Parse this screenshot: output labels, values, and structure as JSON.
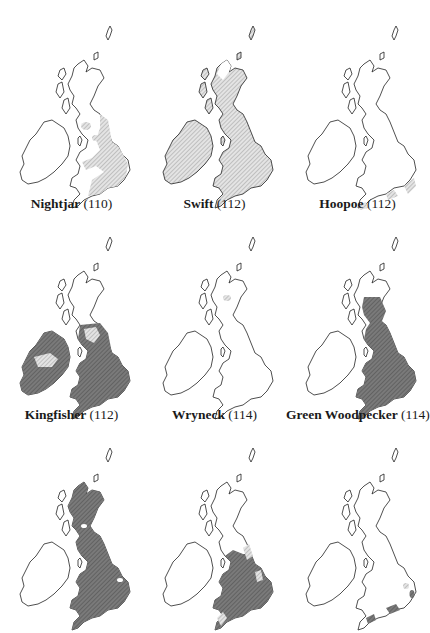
{
  "figure": {
    "type": "species-distribution-map-grid",
    "region": "British Isles",
    "layout": {
      "rows": 3,
      "cols": 3
    },
    "shading_legend": {
      "light_hatch": "#c9c9c9",
      "dark_hatch": "#6d6d6d",
      "outline": "#222222"
    },
    "maps": [
      {
        "name": "Nightjar",
        "page": "(110)",
        "shade": "light",
        "has_label": true
      },
      {
        "name": "Swift",
        "page": "(112)",
        "shade": "light",
        "has_label": true
      },
      {
        "name": "Hoopoe",
        "page": "(112)",
        "shade": "light",
        "has_label": true
      },
      {
        "name": "Kingfisher",
        "page": "(112)",
        "shade": "dark",
        "has_label": true
      },
      {
        "name": "Wryneck",
        "page": "(114)",
        "shade": "light",
        "has_label": true
      },
      {
        "name": "Green Woodpecker",
        "page": "(114)",
        "shade": "dark",
        "has_label": true
      },
      {
        "name": "",
        "page": "",
        "shade": "dark",
        "has_label": false
      },
      {
        "name": "",
        "page": "",
        "shade": "dark",
        "has_label": false
      },
      {
        "name": "",
        "page": "",
        "shade": "dark",
        "has_label": false
      }
    ]
  }
}
